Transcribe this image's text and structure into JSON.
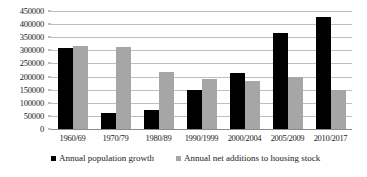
{
  "chart_data": {
    "type": "bar",
    "title": "",
    "subtitle": "",
    "xlabel": "",
    "ylabel": "",
    "ylim": [
      0,
      450000
    ],
    "ytick_step": 50000,
    "yticks": [
      "450000",
      "400000",
      "350000",
      "300000",
      "250000",
      "200000",
      "150000",
      "100000",
      "50000",
      "0"
    ],
    "grid": "horizontal",
    "legend_position": "bottom",
    "categories": [
      "1960/69",
      "1970/79",
      "1980/89",
      "1990/1999",
      "2000/2004",
      "2005/2009",
      "2010/2017"
    ],
    "series": [
      {
        "name": "Annual population growth",
        "color": "#000000",
        "values": [
          308000,
          60000,
          73000,
          148000,
          213000,
          368000,
          428000
        ]
      },
      {
        "name": "Annual net additions to housing stock",
        "color": "#a6a6a6",
        "values": [
          315000,
          313000,
          217000,
          190000,
          185000,
          199000,
          150000
        ]
      }
    ]
  },
  "legend": {
    "items": [
      {
        "label": "Annual population growth",
        "swatch": "series-a"
      },
      {
        "label": "Annual net additions to housing stock",
        "swatch": "series-b"
      }
    ]
  }
}
